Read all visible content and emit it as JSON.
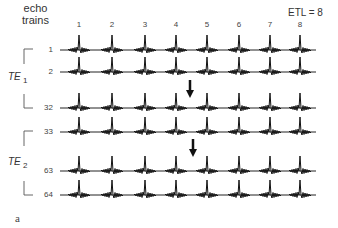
{
  "header": {
    "line1": "echo",
    "line2": "trains"
  },
  "etl_label": "ETL = 8",
  "echo_numbers": [
    "1",
    "2",
    "3",
    "4",
    "5",
    "6",
    "7",
    "8"
  ],
  "echo_x": [
    79,
    112,
    145,
    176,
    207,
    239,
    270,
    300
  ],
  "rows": [
    {
      "label": "1",
      "y": 50
    },
    {
      "label": "2",
      "y": 72
    },
    {
      "label": "32",
      "y": 108
    },
    {
      "label": "33",
      "y": 132
    },
    {
      "label": "63",
      "y": 171
    },
    {
      "label": "64",
      "y": 195
    }
  ],
  "groups": [
    {
      "name": "TE",
      "sub": "1",
      "top": 50,
      "bottom": 108
    },
    {
      "name": "TE",
      "sub": "2",
      "top": 132,
      "bottom": 195
    }
  ],
  "arrows": [
    {
      "x": 190,
      "y1": 80,
      "y2": 98
    },
    {
      "x": 193,
      "y1": 139,
      "y2": 157
    }
  ],
  "panel_label": "a"
}
